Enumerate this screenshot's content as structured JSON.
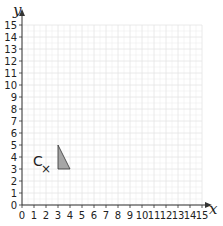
{
  "chart_data": {
    "type": "scatter",
    "title": "",
    "xlabel": "x",
    "ylabel": "y",
    "xlim": [
      0,
      15
    ],
    "ylim": [
      0,
      15
    ],
    "grid": true,
    "x_ticks": [
      "0",
      "1",
      "2",
      "3",
      "4",
      "5",
      "6",
      "7",
      "8",
      "9",
      "10",
      "11",
      "12",
      "13",
      "14",
      "15"
    ],
    "y_ticks": [
      "0",
      "1",
      "2",
      "3",
      "4",
      "5",
      "6",
      "7",
      "8",
      "9",
      "10",
      "11",
      "12",
      "13",
      "14",
      "15"
    ],
    "shapes": [
      {
        "name": "triangle",
        "vertices": [
          [
            3,
            3
          ],
          [
            3,
            5
          ],
          [
            4,
            3
          ]
        ],
        "fill": "#a6a6a6",
        "stroke": "#333333"
      }
    ],
    "points": [
      {
        "label": "C",
        "x": 2,
        "y": 3,
        "marker": "×"
      }
    ]
  },
  "colors": {
    "grid": "#e4e4e4",
    "axis": "#333333"
  }
}
